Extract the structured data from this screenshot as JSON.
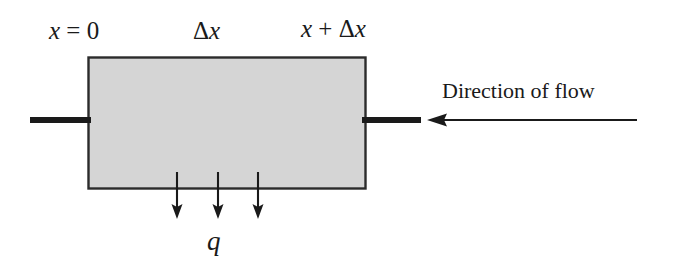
{
  "figure": {
    "type": "diagram",
    "background_color": "#ffffff",
    "ink_color": "#1a1a1a",
    "control_volume": {
      "name": "control-volume-box",
      "fill_color": "#d5d5d5",
      "stroke_color": "#2b2b2b",
      "x": 88,
      "y": 57,
      "width": 277,
      "height": 131
    },
    "labels": {
      "left_boundary": {
        "text_math": "x = 0",
        "x_part": "x",
        "operator": " = ",
        "value": "0"
      },
      "element_width": {
        "text_math": "Δx",
        "delta": "Δ",
        "x_part": "x"
      },
      "right_boundary": {
        "text_math": "x + Δx",
        "x_part": "x",
        "operator": " + ",
        "delta": "Δ",
        "x_part_2": "x"
      },
      "sink_term": {
        "text_math": "q"
      },
      "flow_annotation": {
        "text": "Direction of flow"
      }
    },
    "flow_arrow": {
      "name": "direction-of-flow-arrow",
      "points": "left",
      "tail_x": 637,
      "tip_x": 427,
      "y": 120
    },
    "inlet_stub": {
      "name": "inlet-flow-stub",
      "x1": 30,
      "x2": 90,
      "y": 120,
      "thickness": 6
    },
    "outlet_stub": {
      "name": "outlet-flow-stub",
      "x1": 363,
      "x2": 421,
      "y": 120,
      "thickness": 6
    },
    "sink_arrows": {
      "name": "sink-flux-arrows",
      "count": 3,
      "direction": "down",
      "x_positions": [
        177,
        218,
        258
      ],
      "y_start": 172,
      "y_end": 219
    }
  }
}
